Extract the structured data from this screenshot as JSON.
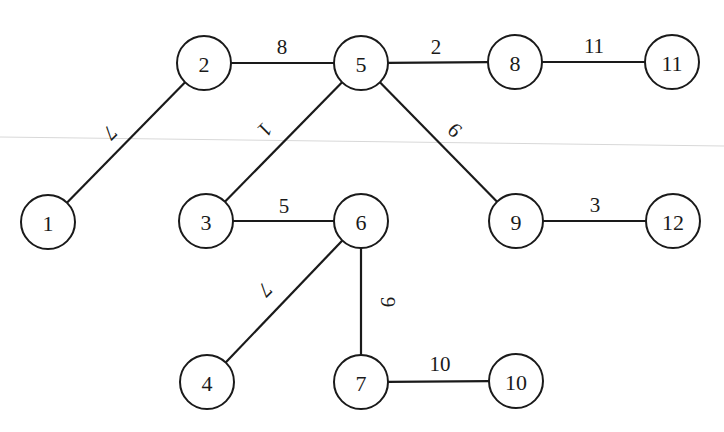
{
  "diagram": {
    "type": "weighted-tree",
    "colors": {
      "stroke": "#1a1a1a",
      "background": "#ffffff",
      "fold_line": "#d8d8d8"
    },
    "node_radius": 27,
    "nodes": [
      {
        "id": "1",
        "label": "1",
        "x": 48,
        "y": 222
      },
      {
        "id": "2",
        "label": "2",
        "x": 204,
        "y": 63
      },
      {
        "id": "3",
        "label": "3",
        "x": 206,
        "y": 221
      },
      {
        "id": "4",
        "label": "4",
        "x": 207,
        "y": 382
      },
      {
        "id": "5",
        "label": "5",
        "x": 361,
        "y": 63
      },
      {
        "id": "6",
        "label": "6",
        "x": 361,
        "y": 221
      },
      {
        "id": "7",
        "label": "7",
        "x": 361,
        "y": 382
      },
      {
        "id": "8",
        "label": "8",
        "x": 515,
        "y": 62
      },
      {
        "id": "9",
        "label": "9",
        "x": 516,
        "y": 221
      },
      {
        "id": "10",
        "label": "10",
        "x": 516,
        "y": 381
      },
      {
        "id": "11",
        "label": "11",
        "x": 672,
        "y": 62
      },
      {
        "id": "12",
        "label": "12",
        "x": 673,
        "y": 221
      }
    ],
    "edges": [
      {
        "from": "1",
        "to": "2",
        "weight": "7",
        "lx": 110,
        "ly": 133,
        "rot": 135
      },
      {
        "from": "2",
        "to": "5",
        "weight": "8",
        "lx": 282,
        "ly": 47,
        "rot": 0
      },
      {
        "from": "3",
        "to": "5",
        "weight": "1",
        "lx": 265,
        "ly": 130,
        "rot": 135
      },
      {
        "from": "5",
        "to": "8",
        "weight": "2",
        "lx": 436,
        "ly": 47,
        "rot": 0
      },
      {
        "from": "5",
        "to": "9",
        "weight": "6",
        "lx": 455,
        "ly": 130,
        "rot": 45
      },
      {
        "from": "8",
        "to": "11",
        "weight": "11",
        "lx": 594,
        "ly": 46,
        "rot": 0
      },
      {
        "from": "3",
        "to": "6",
        "weight": "5",
        "lx": 284,
        "ly": 206,
        "rot": 0
      },
      {
        "from": "9",
        "to": "12",
        "weight": "3",
        "lx": 595,
        "ly": 205,
        "rot": 0
      },
      {
        "from": "4",
        "to": "6",
        "weight": "7",
        "lx": 265,
        "ly": 290,
        "rot": 135
      },
      {
        "from": "6",
        "to": "7",
        "weight": "9",
        "lx": 388,
        "ly": 302,
        "rot": 90
      },
      {
        "from": "7",
        "to": "10",
        "weight": "10",
        "lx": 440,
        "ly": 364,
        "rot": 0
      }
    ]
  }
}
